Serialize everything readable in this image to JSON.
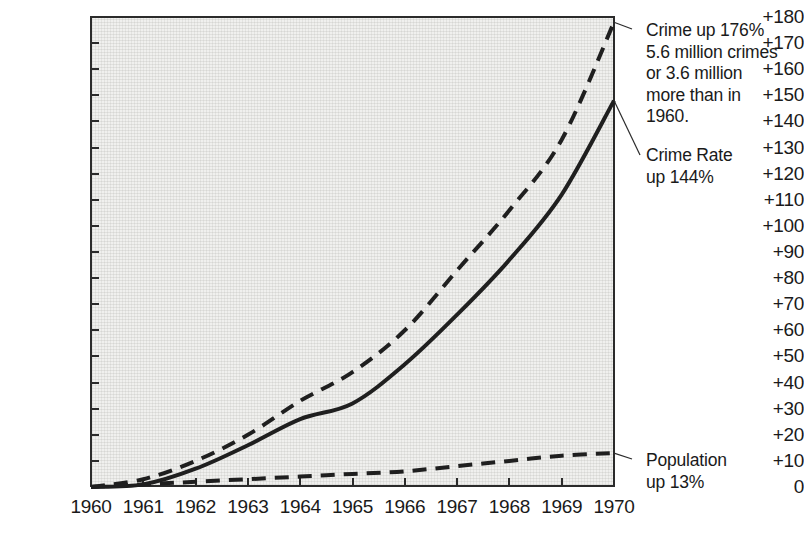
{
  "chart_data": {
    "type": "line",
    "title": "",
    "subtitle": "",
    "xlabel": "",
    "ylabel": "",
    "xlim": [
      1960,
      1970
    ],
    "ylim": [
      0,
      180
    ],
    "grid": false,
    "legend_position": "right-annotations",
    "x": [
      1960,
      1961,
      1962,
      1963,
      1964,
      1965,
      1966,
      1967,
      1968,
      1969,
      1970
    ],
    "x_tick_labels": [
      "1960",
      "1961",
      "1962",
      "1963",
      "1964",
      "1965",
      "1966",
      "1967",
      "1968",
      "1969",
      "1970"
    ],
    "y_tick_labels": [
      "0",
      "+10",
      "+20",
      "+30",
      "+40",
      "+50",
      "+60",
      "+70",
      "+80",
      "+90",
      "+100",
      "+110",
      "+120",
      "+130",
      "+140",
      "+150",
      "+160",
      "+170",
      "+180"
    ],
    "y_tick_values": [
      0,
      10,
      20,
      30,
      40,
      50,
      60,
      70,
      80,
      90,
      100,
      110,
      120,
      130,
      140,
      150,
      160,
      170,
      180
    ],
    "series": [
      {
        "name": "Crime",
        "style": "dashed",
        "values": [
          0,
          3,
          10,
          20,
          33,
          44,
          60,
          83,
          106,
          133,
          178
        ]
      },
      {
        "name": "Crime Rate",
        "style": "solid",
        "values": [
          0,
          1,
          7,
          16,
          26,
          32,
          47,
          66,
          87,
          112,
          148
        ]
      },
      {
        "name": "Population",
        "style": "dashed",
        "values": [
          0,
          1,
          2,
          3,
          4,
          5,
          6,
          8,
          10,
          12,
          13
        ]
      }
    ],
    "annotations": [
      {
        "id": "crime-annotation",
        "text": "Crime up 176%\n5.6 million crimes\nor 3.6 million\nmore than in\n1960.",
        "target_series": "Crime",
        "target_x": 1970,
        "target_y": 178
      },
      {
        "id": "crime-rate-annotation",
        "text": "Crime Rate\nup 144%",
        "target_series": "Crime Rate",
        "target_x": 1970,
        "target_y": 148
      },
      {
        "id": "population-annotation",
        "text": "Population\nup 13%",
        "target_series": "Population",
        "target_x": 1970,
        "target_y": 13
      }
    ],
    "colors": {
      "line": "#1f1f1f",
      "plot_background": "#f0f0ee",
      "axis": "#2b2b2b",
      "text": "#1a1a1a"
    }
  },
  "caption_fragment": ""
}
